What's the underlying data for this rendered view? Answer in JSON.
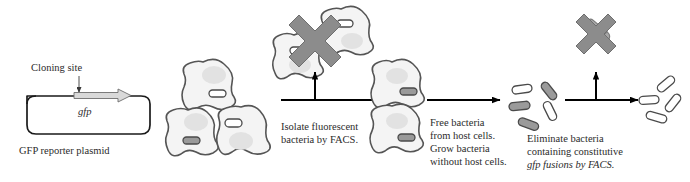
{
  "figure": {
    "name": "dfi-facs-selection-workflow",
    "type": "biology-process-diagram",
    "background_color": "#ffffff"
  },
  "plasmid": {
    "cloning_site_label": "Cloning site",
    "gene_label": "gfp",
    "caption": "GFP reporter plasmid",
    "outline_color": "#1a1a1a",
    "arrow_fill": "#d9d9d9"
  },
  "steps": [
    {
      "id": "step-1",
      "label_lines": [
        "Isolate fluorescent",
        "bacteria by FACS."
      ],
      "arrow": "branched-right"
    },
    {
      "id": "step-2",
      "label_lines": [
        "Free bacteria",
        "from host cells.",
        "Grow bacteria",
        "without host cells."
      ],
      "arrow": "straight-right"
    },
    {
      "id": "step-3",
      "label_lines": [
        "Eliminate bacteria",
        "containing constitutive",
        "gfp fusions by FACS."
      ],
      "italic_word": "gfp",
      "arrow": "branched-right"
    }
  ],
  "populations": {
    "host_cell_cluster": {
      "name": "infected-host-cells",
      "count": 3
    },
    "selected_host_cells": {
      "name": "selected-host-cells",
      "count": 2
    },
    "discarded_host_cells": {
      "name": "discarded-host-cells",
      "count": 2,
      "marked": "x-cross"
    },
    "free_bacteria": {
      "name": "free-bacteria",
      "count": 5,
      "filled": 3,
      "unfilled": 2
    },
    "final_bacteria": {
      "name": "retained-bacteria",
      "count": 4,
      "filled": 0,
      "unfilled": 4
    },
    "discarded_bacteria": {
      "name": "discarded-bacteria",
      "count": 2,
      "marked": "x-cross"
    }
  },
  "colors": {
    "cell_fill": "#f4f4f4",
    "cell_stroke": "#555555",
    "nucleus_fill": "#e0e0e0",
    "bacterium_gray": "#9a9a9a",
    "bacterium_white": "#ffffff",
    "cross_fill": "#8c8c8c",
    "arrow_black": "#000000",
    "text": "#2b2b2b"
  }
}
